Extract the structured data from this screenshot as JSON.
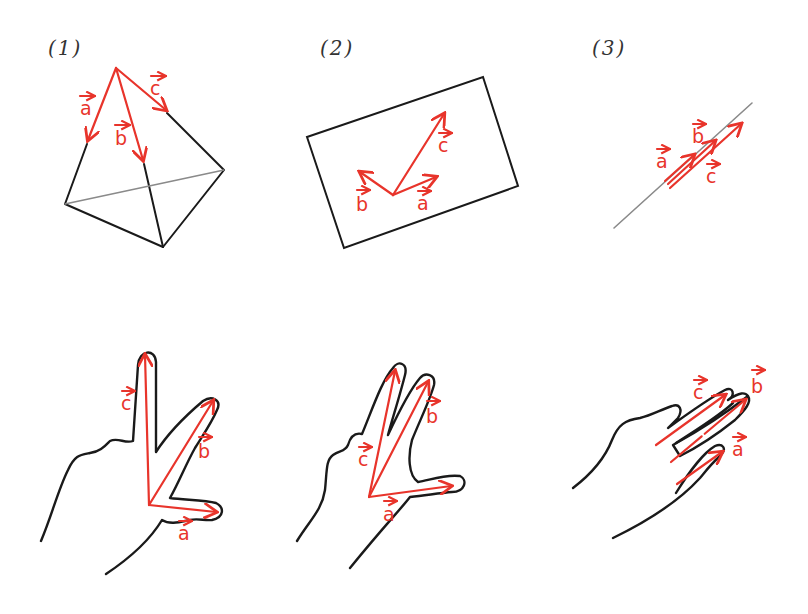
{
  "colors": {
    "vector": "#e8342b",
    "outline": "#1a1a1a",
    "hidden_edge": "#8a8a8a",
    "background": "#ffffff"
  },
  "panels": [
    {
      "label": "(1)",
      "title": "non-coplanar vectors on tetrahedron",
      "vectors": {
        "a": "a",
        "b": "b",
        "c": "c"
      },
      "hand": {
        "vectors": {
          "a": "a",
          "b": "b",
          "c": "c"
        }
      }
    },
    {
      "label": "(2)",
      "title": "coplanar vectors on plane",
      "vectors": {
        "a": "a",
        "b": "b",
        "c": "c"
      },
      "hand": {
        "vectors": {
          "a": "a",
          "b": "b",
          "c": "c"
        }
      }
    },
    {
      "label": "(3)",
      "title": "collinear vectors on line",
      "vectors": {
        "a": "a",
        "b": "b",
        "c": "c"
      },
      "hand": {
        "vectors": {
          "a": "a",
          "b": "b",
          "c": "c"
        }
      }
    }
  ]
}
